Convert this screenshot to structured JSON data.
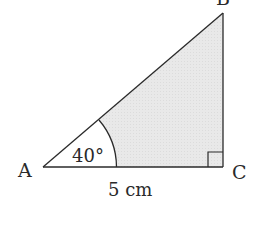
{
  "diagram": {
    "type": "right-triangle",
    "vertices": {
      "A": {
        "label": "A"
      },
      "B": {
        "label": "B"
      },
      "C": {
        "label": "C"
      }
    },
    "angle_A": {
      "label": "40°",
      "value_deg": 40
    },
    "side_AC": {
      "label": "5 cm",
      "value": 5,
      "unit": "cm"
    },
    "right_angle_at": "C",
    "colors": {
      "stroke": "#2a2a2a",
      "fill": "#e6e6e6",
      "background": "#ffffff"
    }
  }
}
